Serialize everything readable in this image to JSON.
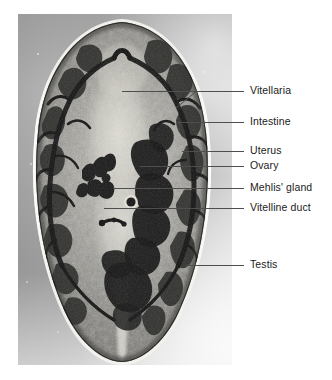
{
  "figure": {
    "kind": "labeled-photomicrograph",
    "plate": {
      "left": 18,
      "top": 14,
      "width": 214,
      "height": 351
    },
    "colors": {
      "label_text": "#1b1b1b",
      "leader_line": "#4e4e4e",
      "page_background": "#ffffff",
      "slide_background": "#9d9d9d",
      "tissue_dark": "#1d1d1d",
      "tissue_mid": "#6e6e6e",
      "tissue_light": "#d6d6d2"
    }
  },
  "labels": [
    {
      "id": "vitellaria",
      "text": "Vitellaria",
      "y": 91,
      "leader": {
        "x1": 122,
        "x2": 244,
        "branch": {
          "x": 94,
          "y": 106
        }
      }
    },
    {
      "id": "intestine",
      "text": "Intestine",
      "y": 122,
      "leader": {
        "x1": 176,
        "x2": 244,
        "branch": null
      }
    },
    {
      "id": "uterus",
      "text": "Uterus",
      "y": 151,
      "leader": {
        "x1": 182,
        "x2": 244,
        "branch": null
      }
    },
    {
      "id": "ovary",
      "text": "Ovary",
      "y": 166,
      "leader": {
        "x1": 140,
        "x2": 244,
        "branch": null
      }
    },
    {
      "id": "mehlis-gland",
      "text": "Mehlis' gland",
      "y": 188,
      "leader": {
        "x1": 113,
        "x2": 244,
        "branch": null
      }
    },
    {
      "id": "vitelline-duct",
      "text": "Vitelline duct",
      "y": 208,
      "leader": {
        "x1": 104,
        "x2": 244,
        "branch": null
      }
    },
    {
      "id": "testis",
      "text": "Testis",
      "y": 265,
      "leader": {
        "x1": 186,
        "x2": 244,
        "branch": null
      }
    }
  ]
}
